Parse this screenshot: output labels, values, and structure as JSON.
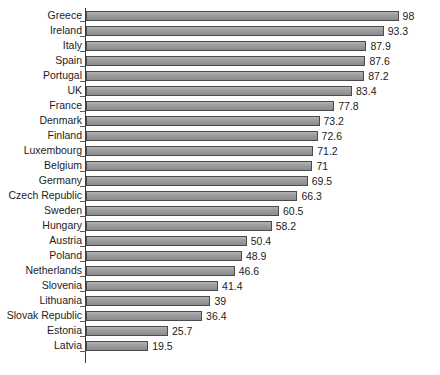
{
  "chart_data": {
    "type": "bar",
    "orientation": "horizontal",
    "title": "",
    "subtitle": "",
    "xlabel": "",
    "ylabel": "",
    "xlim": [
      0,
      110
    ],
    "ylim": null,
    "grid": false,
    "legend": null,
    "legend_position": "none",
    "axis_line": "left-spine-only",
    "bar_fill_color": "#9a9a9a",
    "bar_edge_color": "#4a4a4a",
    "text_color": "#1c1c1c",
    "background_color": "#ffffff",
    "value_label_position": "outside-end",
    "categories": [
      "Greece",
      "Ireland",
      "Italy",
      "Spain",
      "Portugal",
      "UK",
      "France",
      "Denmark",
      "Finland",
      "Luxembourg",
      "Belgium",
      "Germany",
      "Czech Republic",
      "Sweden",
      "Hungary",
      "Austria",
      "Poland",
      "Netherlands",
      "Slovenia",
      "Lithuania",
      "Slovak Republic",
      "Estonia",
      "Latvia"
    ],
    "values": [
      98,
      93.3,
      87.9,
      87.6,
      87.2,
      83.4,
      77.8,
      73.2,
      72.6,
      71.2,
      71,
      69.5,
      66.3,
      60.5,
      58.2,
      50.4,
      48.9,
      46.6,
      41.4,
      39,
      36.4,
      25.7,
      19.5
    ],
    "value_labels": [
      "98",
      "93.3",
      "87.9",
      "87.6",
      "87.2",
      "83.4",
      "77.8",
      "73.2",
      "72.6",
      "71.2",
      "71",
      "69.5",
      "66.3",
      "60.5",
      "58.2",
      "50.4",
      "48.9",
      "46.6",
      "41.4",
      "39",
      "36.4",
      "25.7",
      "19.5"
    ]
  }
}
